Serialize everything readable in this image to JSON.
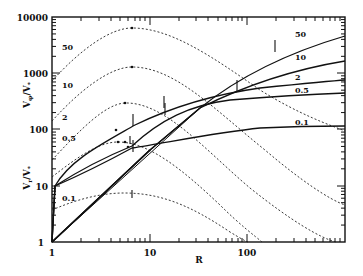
{
  "chart_data": {
    "type": "line",
    "title": "",
    "xlabel": "R",
    "ylabel": "V_φ/V_*",
    "ylabel2": "V_r/V_*",
    "xscale": "log",
    "yscale": "log",
    "xlim": [
      1,
      1000
    ],
    "ylim": [
      1,
      10000
    ],
    "x_tick_labels": [
      "1",
      "10",
      "100"
    ],
    "y_tick_labels": [
      "1",
      "10",
      "100",
      "1000",
      "10000"
    ],
    "grid": false,
    "legend": "inline labels",
    "series_dotted_label": "V_phi/V_* (dashed)",
    "series_solid_label": "V_r/V_* (solid)",
    "dotted_series": [
      {
        "name": "50",
        "x": [
          1,
          2,
          4,
          6.6,
          12,
          30,
          100,
          450
        ],
        "values": [
          730,
          2300,
          5200,
          6300,
          4800,
          1800,
          400,
          60
        ],
        "label_pos": [
          1.35,
          480
        ]
      },
      {
        "name": "10",
        "x": [
          1,
          2,
          4,
          6.6,
          12,
          30,
          100,
          1000
        ],
        "values": [
          150,
          480,
          1050,
          1250,
          960,
          370,
          85,
          4.5
        ],
        "label_pos": [
          1.35,
          95
        ]
      },
      {
        "name": "2",
        "x": [
          1,
          2,
          4,
          6.6,
          12,
          30,
          100,
          1000
        ],
        "values": [
          28,
          95,
          220,
          265,
          200,
          75,
          17,
          1
        ],
        "label_pos": [
          1.35,
          20
        ]
      },
      {
        "name": "0.5",
        "x": [
          1,
          2,
          4,
          6.6,
          12,
          30,
          100,
          320
        ],
        "values": [
          14,
          38,
          58,
          62,
          45,
          18,
          4.2,
          1
        ],
        "label_pos": [
          1.35,
          11
        ]
      },
      {
        "name": "0.1",
        "x": [
          1,
          2,
          4,
          6.6,
          12,
          30,
          100,
          200
        ],
        "values": [
          3.8,
          5.5,
          6.8,
          6.9,
          5.5,
          2.5,
          1.2,
          1
        ],
        "label_pos": [
          1.35,
          3
        ]
      }
    ],
    "solid_series": [
      {
        "name": "50",
        "x": [
          1,
          3,
          7,
          15,
          30,
          60,
          150,
          400,
          1000
        ],
        "values": [
          1,
          9,
          50,
          200,
          600,
          1200,
          2300,
          3500,
          4500
        ]
      },
      {
        "name": "10",
        "x": [
          1,
          3,
          7,
          15,
          30,
          60,
          150,
          400,
          1000
        ],
        "values": [
          1,
          9,
          50,
          200,
          420,
          650,
          950,
          1250,
          1450
        ]
      },
      {
        "name": "2",
        "x": [
          1,
          1.05,
          3,
          7,
          15,
          30,
          100,
          300,
          1000
        ],
        "values": [
          1,
          10,
          45,
          160,
          260,
          360,
          520,
          640,
          720
        ]
      },
      {
        "name": "0.5",
        "x": [
          1,
          1.05,
          5,
          7,
          15,
          40,
          100,
          300,
          1000
        ],
        "values": [
          1,
          10,
          45,
          60,
          220,
          300,
          360,
          420,
          450
        ]
      },
      {
        "name": "0.1",
        "x": [
          1,
          1.05,
          3,
          7,
          15,
          40,
          100,
          300,
          1000
        ],
        "values": [
          1,
          10,
          28,
          45,
          60,
          85,
          100,
          110,
          120
        ]
      }
    ],
    "right_labels": [
      "50",
      "10",
      "2",
      "0.5",
      "0.1"
    ],
    "left_labels": [
      "50",
      "10",
      "2",
      "0.5",
      "0.1"
    ],
    "markers": "tick marks and dots on curves at transition radii"
  },
  "axes": {
    "x_label": "R",
    "y_label_top": "V",
    "y_label_top_sub": "φ",
    "y_label_top_den": "/V",
    "y_label_bottom": "V",
    "y_label_bottom_sub": "r",
    "y_tick_1": "1",
    "y_tick_10": "10",
    "y_tick_100": "100",
    "y_tick_1000": "1000",
    "y_tick_10000": "10000",
    "x_tick_1": "1",
    "x_tick_10": "10",
    "x_tick_100": "100"
  },
  "labels": {
    "d50": "50",
    "d10": "10",
    "d2": "2",
    "d05": "0.5",
    "d01": "0.1",
    "s50": "50",
    "s10": "10",
    "s2": "2",
    "s05": "0.5",
    "s01": "0.1"
  }
}
